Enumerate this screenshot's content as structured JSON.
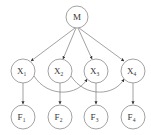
{
  "diagram": {
    "type": "directed-graphical-model",
    "colors": {
      "node_stroke": "#8a8a8a",
      "edge_stroke": "#7a7a7a",
      "label": "#333333",
      "background": "#ffffff"
    },
    "nodes": {
      "M": {
        "label": "M",
        "sub": "",
        "cx": 77,
        "cy": 17,
        "r": 11
      },
      "X1": {
        "label": "X",
        "sub": "1",
        "cx": 23,
        "cy": 71,
        "r": 12
      },
      "X2": {
        "label": "X",
        "sub": "2",
        "cx": 60,
        "cy": 71,
        "r": 12
      },
      "X3": {
        "label": "X",
        "sub": "3",
        "cx": 96,
        "cy": 71,
        "r": 12
      },
      "X4": {
        "label": "X",
        "sub": "4",
        "cx": 133,
        "cy": 71,
        "r": 12
      },
      "F1": {
        "label": "F",
        "sub": "1",
        "cx": 23,
        "cy": 117,
        "r": 12
      },
      "F2": {
        "label": "F",
        "sub": "2",
        "cx": 60,
        "cy": 117,
        "r": 12
      },
      "F3": {
        "label": "F",
        "sub": "3",
        "cx": 96,
        "cy": 117,
        "r": 12
      },
      "F4": {
        "label": "F",
        "sub": "4",
        "cx": 133,
        "cy": 117,
        "r": 12
      }
    },
    "edges": [
      {
        "from": "M",
        "to": "X1",
        "style": "straight"
      },
      {
        "from": "M",
        "to": "X2",
        "style": "straight"
      },
      {
        "from": "M",
        "to": "X3",
        "style": "straight"
      },
      {
        "from": "M",
        "to": "X4",
        "style": "straight"
      },
      {
        "from": "X1",
        "to": "F1",
        "style": "straight"
      },
      {
        "from": "X2",
        "to": "F2",
        "style": "straight"
      },
      {
        "from": "X3",
        "to": "F3",
        "style": "straight"
      },
      {
        "from": "X4",
        "to": "F4",
        "style": "straight"
      },
      {
        "from": "X1",
        "to": "X3",
        "style": "curved-below"
      },
      {
        "from": "X2",
        "to": "X4",
        "style": "curved-below"
      }
    ]
  }
}
